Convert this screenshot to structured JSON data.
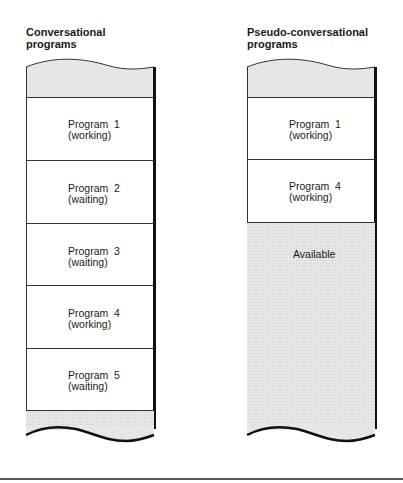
{
  "diagram": {
    "left": {
      "title_line1": "Conversational",
      "title_line2": "programs",
      "blocks": [
        {
          "kind": "shaded",
          "label": ""
        },
        {
          "kind": "program",
          "label_line1": "Program  1",
          "label_line2": "(working)"
        },
        {
          "kind": "program",
          "label_line1": "Program  2",
          "label_line2": "(waiting)"
        },
        {
          "kind": "program",
          "label_line1": "Program  3",
          "label_line2": "(waiting)"
        },
        {
          "kind": "program",
          "label_line1": "Program  4",
          "label_line2": "(working)"
        },
        {
          "kind": "program",
          "label_line1": "Program  5",
          "label_line2": "(waiting)"
        },
        {
          "kind": "shaded",
          "label": ""
        }
      ]
    },
    "right": {
      "title_line1": "Pseudo-conversational",
      "title_line2": "programs",
      "blocks": [
        {
          "kind": "shaded",
          "label": ""
        },
        {
          "kind": "program",
          "label_line1": "Program  1",
          "label_line2": "(working)"
        },
        {
          "kind": "program",
          "label_line1": "Program  4",
          "label_line2": "(working)"
        },
        {
          "kind": "available",
          "label": "Available"
        }
      ]
    },
    "colors": {
      "line": "#333333",
      "shade": "#e6e6e6",
      "text": "#1a1a1a"
    }
  }
}
